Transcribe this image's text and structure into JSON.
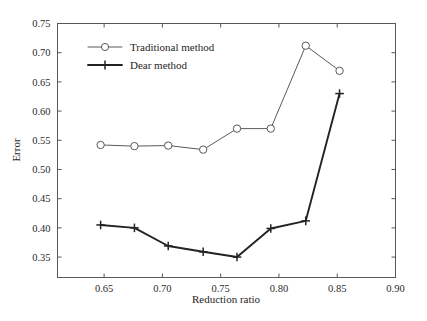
{
  "chart_data": {
    "type": "line",
    "title": "",
    "xlabel": "Reduction ratio",
    "ylabel": "Error",
    "xlim": [
      0.61,
      0.9
    ],
    "ylim": [
      0.315,
      0.75
    ],
    "xticks": [
      0.65,
      0.7,
      0.75,
      0.8,
      0.85,
      0.9
    ],
    "xtick_labels": [
      "0.65",
      "0.70",
      "0.75",
      "0.80",
      "0.85",
      "0.90"
    ],
    "yticks": [
      0.35,
      0.4,
      0.45,
      0.5,
      0.55,
      0.6,
      0.65,
      0.7,
      0.75
    ],
    "ytick_labels": [
      "0.35",
      "0.40",
      "0.45",
      "0.50",
      "0.55",
      "0.60",
      "0.65",
      "0.70",
      "0.75"
    ],
    "grid": false,
    "legend_position": "upper left",
    "x": [
      0.647,
      0.676,
      0.705,
      0.735,
      0.764,
      0.793,
      0.823,
      0.852
    ],
    "series": [
      {
        "name": "Traditional method",
        "marker": "circle",
        "values": [
          0.542,
          0.54,
          0.541,
          0.534,
          0.57,
          0.57,
          0.712,
          0.669
        ]
      },
      {
        "name": "Dear method",
        "marker": "plus",
        "values": [
          0.405,
          0.4,
          0.369,
          0.359,
          0.35,
          0.399,
          0.412,
          0.63
        ]
      }
    ]
  },
  "legend": {
    "items": [
      {
        "label": "Traditional method"
      },
      {
        "label": "Dear method"
      }
    ]
  },
  "colors": {
    "series_traditional": "#5a5a5a",
    "series_dear": "#232323",
    "frame": "#585858",
    "background": "#ffffff"
  }
}
